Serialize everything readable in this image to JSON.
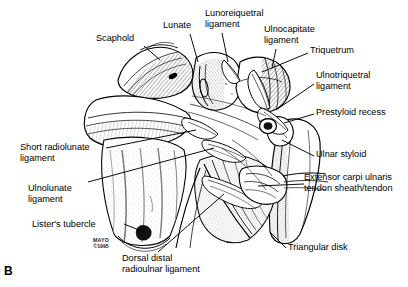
{
  "figure": {
    "panel_letter": "B",
    "background_color": "#ffffff",
    "ink_color": "#000000",
    "width": 408,
    "height": 287
  },
  "credit": {
    "institution": "MAYO",
    "copyright": "©1995"
  },
  "labels": [
    {
      "id": "scaphoid",
      "text": "Scaphold",
      "x": 96,
      "y": 38,
      "align": "left"
    },
    {
      "id": "lunate",
      "text": "Lunate",
      "x": 163,
      "y": 25,
      "align": "left"
    },
    {
      "id": "lunotriquetral",
      "text": "Lunoreiquetral\nligament",
      "x": 205,
      "y": 11,
      "align": "left"
    },
    {
      "id": "ulnocapitate",
      "text": "Ulnocapitate\nligament",
      "x": 264,
      "y": 27,
      "align": "left"
    },
    {
      "id": "triquetrum",
      "text": "Triquetrum",
      "x": 310,
      "y": 49,
      "align": "left"
    },
    {
      "id": "ulnotriquetral",
      "text": "Ulnotriquetral\nligament",
      "x": 316,
      "y": 73,
      "align": "left"
    },
    {
      "id": "prestyloid-recess",
      "text": "Prestyloid recess",
      "x": 316,
      "y": 110,
      "align": "left"
    },
    {
      "id": "ulnar-styloid",
      "text": "Ulnar styloid",
      "x": 316,
      "y": 152,
      "align": "left"
    },
    {
      "id": "ecu",
      "text": "Extensor carpi ulnaris\ntendon sheath/tendon",
      "x": 306,
      "y": 175,
      "align": "left"
    },
    {
      "id": "triangular-disk",
      "text": "Triangular disk",
      "x": 288,
      "y": 245,
      "align": "left"
    },
    {
      "id": "short-radiolunate",
      "text": "Short radiolunate\nligament",
      "x": 20,
      "y": 145,
      "align": "left"
    },
    {
      "id": "ulnolunate",
      "text": "Ulnolunate\nligament",
      "x": 28,
      "y": 186,
      "align": "left"
    },
    {
      "id": "listers-tubercle",
      "text": "Lister's tubercle",
      "x": 32,
      "y": 222,
      "align": "left"
    },
    {
      "id": "dorsal-drul",
      "text": "Dorsal distal\nradioulnar ligament",
      "x": 122,
      "y": 256,
      "align": "left"
    }
  ],
  "leaders": [
    {
      "id": "leader-scaphoid",
      "points": "144,46 160,60"
    },
    {
      "id": "leader-lunate",
      "points": "190,34 198,62"
    },
    {
      "id": "leader-lunotriquetral",
      "points": "222,33 228,62"
    },
    {
      "id": "leader-ulnocapitate",
      "points": "276,49 272,68"
    },
    {
      "id": "leader-triquetrum",
      "points": "308,53 262,72"
    },
    {
      "id": "leader-ulnotriquetral",
      "points": "314,84 276,110"
    },
    {
      "id": "leader-prestyloid",
      "points": "314,114 286,124"
    },
    {
      "id": "leader-ulnar-styloid",
      "points": "314,156 280,140"
    },
    {
      "id": "leader-ecu",
      "points": "304,184 256,188"
    },
    {
      "id": "leader-triangular-disk",
      "points": "286,248 272,234"
    },
    {
      "id": "leader-short-radiolunate",
      "points": "106,148 196,130"
    },
    {
      "id": "leader-ulnolunate",
      "points": "88,182 214,148"
    },
    {
      "id": "leader-listers",
      "points": "124,224 146,234"
    },
    {
      "id": "leader-dorsal-drul",
      "points": "158,252 224,194"
    }
  ],
  "anatomy_structures": [
    "Scaphoid",
    "Lunate",
    "Triquetrum",
    "Ulnar styloid",
    "Radius",
    "Ulna",
    "Triangular disk",
    "Lunotriquetral ligament",
    "Ulnocapitate ligament",
    "Ulnotriquetral ligament",
    "Short radiolunate ligament",
    "Ulnolunate ligament",
    "Dorsal distal radioulnar ligament",
    "Extensor carpi ulnaris tendon sheath/tendon",
    "Prestyloid recess",
    "Lister's tubercle"
  ]
}
